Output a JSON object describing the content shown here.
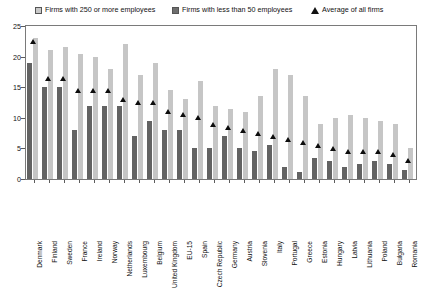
{
  "legend": {
    "big_label": "Firms with 250 or more employees",
    "small_label": "Firms with less than 50 employees",
    "avg_label": "Average of all firms",
    "big_swatch_icon": "square-light-gray-icon",
    "small_swatch_icon": "square-dark-gray-icon",
    "avg_marker_icon": "triangle-up-icon"
  },
  "axis": {
    "y_ticks": [
      "0",
      "5",
      "10",
      "15",
      "20",
      "25"
    ],
    "y_min": 0,
    "y_max": 25
  },
  "colors": {
    "big_firms": "#c6c6c6",
    "small_firms": "#636363",
    "average_marker": "#0d0d0d",
    "axis": "#7a7a7a",
    "background": "#ffffff"
  },
  "chart_data": {
    "type": "bar",
    "title": "",
    "xlabel": "",
    "ylabel": "",
    "ylim": [
      0,
      25
    ],
    "grid": false,
    "legend_position": "top",
    "categories": [
      "Denmark",
      "Finland",
      "Sweden",
      "France",
      "Ireland",
      "Norway",
      "Netherlands",
      "Luxembourg",
      "Belgium",
      "United Kingdom",
      "EU-15",
      "Spain",
      "Czech Republic",
      "Germany",
      "Austria",
      "Slovenia",
      "Italy",
      "Portugal",
      "Greece",
      "Estonia",
      "Hungary",
      "Latvia",
      "Lithuania",
      "Poland",
      "Bulgaria",
      "Romania"
    ],
    "series": [
      {
        "name": "Firms with less than 50 employees",
        "color": "#636363",
        "values": [
          19,
          15,
          15,
          8,
          12,
          12,
          12,
          7,
          9.5,
          8,
          8,
          5,
          5,
          7,
          5,
          4.5,
          5.5,
          2,
          1.2,
          3.5,
          3,
          2,
          2.5,
          3,
          2.5,
          1.5
        ]
      },
      {
        "name": "Firms with 250 or more employees",
        "color": "#c6c6c6",
        "values": [
          23,
          21,
          21.5,
          20.5,
          20,
          18,
          22,
          17,
          19,
          14.5,
          13,
          16,
          12,
          11.5,
          11,
          13.5,
          18,
          17,
          13.5,
          9,
          10,
          10.5,
          10,
          9.5,
          9,
          5
        ]
      }
    ],
    "average_series": {
      "name": "Average of all firms",
      "marker": "triangle",
      "color": "#0d0d0d",
      "values": [
        22.5,
        16.5,
        16.5,
        14.5,
        14.5,
        14.5,
        13,
        12.5,
        12.5,
        11,
        10.5,
        10,
        9,
        8.5,
        8,
        7.5,
        7,
        6.5,
        6,
        5.5,
        5,
        4.5,
        4.5,
        4.5,
        4,
        3
      ]
    }
  }
}
